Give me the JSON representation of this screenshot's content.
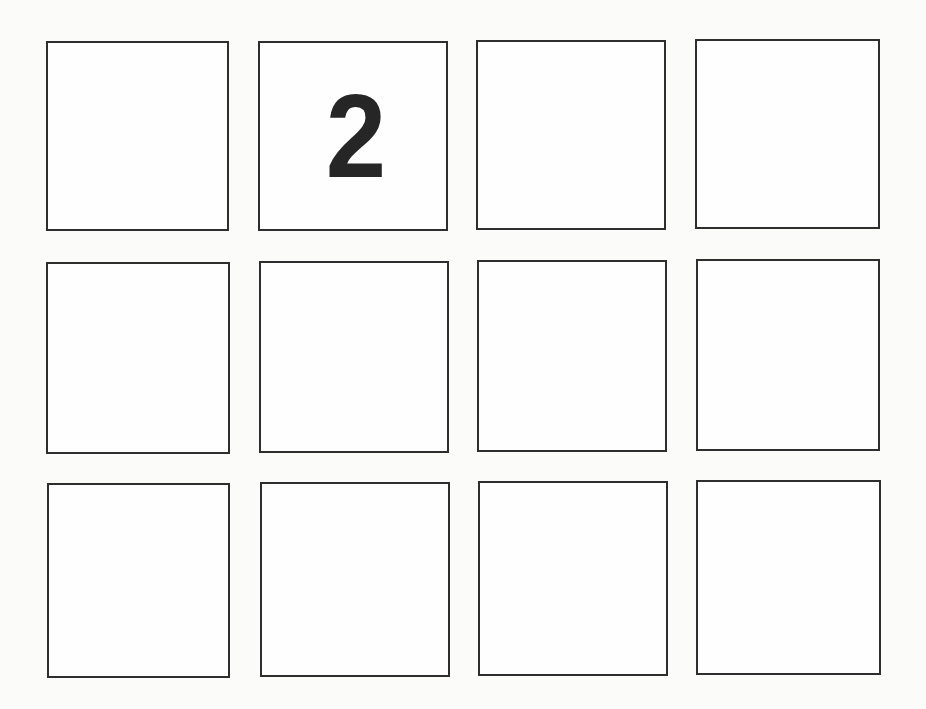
{
  "grid": {
    "rows": 3,
    "columns": 4,
    "colors": {
      "border": "#2e2e2e",
      "cell_background": "#fefefe",
      "page_background": "#fbfbfa",
      "label": "#262626"
    },
    "cells": [
      {
        "row": 1,
        "col": 1,
        "label": "",
        "x": 46,
        "y": 41,
        "w": 183,
        "h": 190
      },
      {
        "row": 1,
        "col": 2,
        "label": "2",
        "x": 258,
        "y": 41,
        "w": 190,
        "h": 190
      },
      {
        "row": 1,
        "col": 3,
        "label": "",
        "x": 476,
        "y": 40,
        "w": 190,
        "h": 190
      },
      {
        "row": 1,
        "col": 4,
        "label": "",
        "x": 695,
        "y": 39,
        "w": 185,
        "h": 190
      },
      {
        "row": 2,
        "col": 1,
        "label": "",
        "x": 46,
        "y": 262,
        "w": 184,
        "h": 192
      },
      {
        "row": 2,
        "col": 2,
        "label": "",
        "x": 259,
        "y": 261,
        "w": 190,
        "h": 192
      },
      {
        "row": 2,
        "col": 3,
        "label": "",
        "x": 477,
        "y": 260,
        "w": 190,
        "h": 192
      },
      {
        "row": 2,
        "col": 4,
        "label": "",
        "x": 696,
        "y": 259,
        "w": 184,
        "h": 192
      },
      {
        "row": 3,
        "col": 1,
        "label": "",
        "x": 47,
        "y": 483,
        "w": 183,
        "h": 195
      },
      {
        "row": 3,
        "col": 2,
        "label": "",
        "x": 260,
        "y": 482,
        "w": 190,
        "h": 195
      },
      {
        "row": 3,
        "col": 3,
        "label": "",
        "x": 478,
        "y": 481,
        "w": 190,
        "h": 195
      },
      {
        "row": 3,
        "col": 4,
        "label": "",
        "x": 696,
        "y": 480,
        "w": 185,
        "h": 195
      }
    ]
  }
}
